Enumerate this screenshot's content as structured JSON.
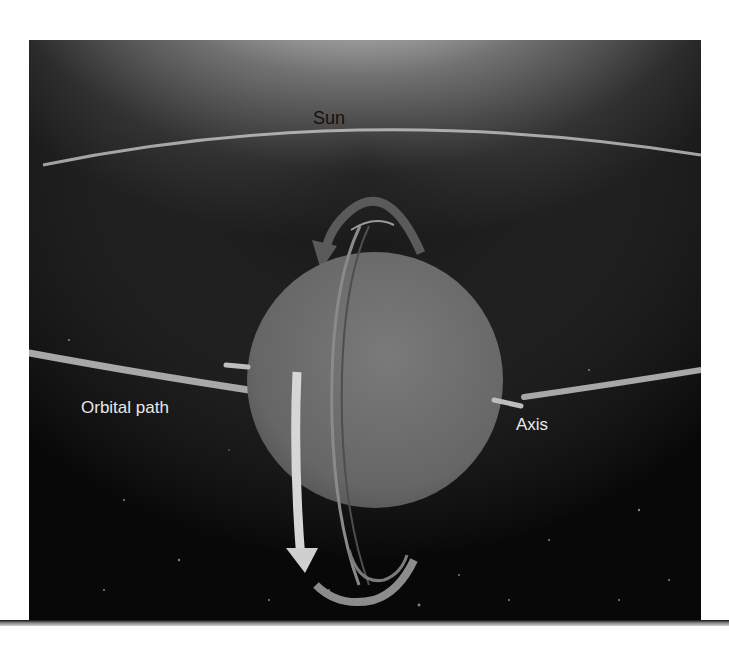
{
  "figure": {
    "type": "illustration",
    "labels": {
      "sun": "Sun",
      "orbital_path": "Orbital path",
      "axis": "Axis"
    },
    "colors": {
      "space": "#0c0c0c",
      "sun_glow": "#ffffff",
      "planet": "#6e6e6e",
      "orbit": "#b5b5b5",
      "arrow_dark": "#555555",
      "arrow_light": "#cfcfcf"
    }
  }
}
